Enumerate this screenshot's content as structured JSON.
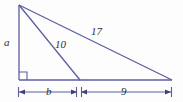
{
  "figure": {
    "background_color": "#fdfdfd",
    "stroke_color": "#5b5fa0",
    "text_color": "#2e2e38",
    "labels": {
      "side_a": "a",
      "cevian_10": "10",
      "hypotenuse_17": "17",
      "base_b": "b",
      "base_9": "9"
    },
    "geometry": {
      "apex": [
        19,
        5
      ],
      "bottom_left_vertex": [
        19,
        80
      ],
      "foot_point": [
        80,
        80
      ],
      "right_vertex": [
        172,
        80
      ],
      "right_angle_marker": [
        19,
        72,
        8,
        8
      ],
      "dimension_line_y": 92,
      "dimension_ticks_x": [
        18,
        76,
        81,
        171
      ]
    },
    "values": {
      "vertical_leg": "a",
      "cevian_length": "10",
      "hypotenuse_length": "17",
      "left_base_segment": "b",
      "right_base_segment": "9"
    }
  }
}
